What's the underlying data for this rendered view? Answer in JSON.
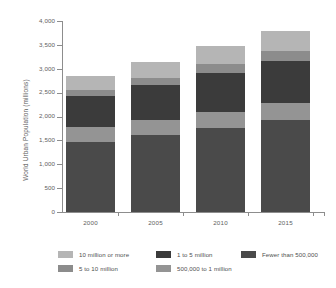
{
  "chart_data": {
    "type": "bar",
    "subtype": "stacked-vertical",
    "title": "",
    "xlabel": "",
    "ylabel": "World Urban Population (millions)",
    "categories": [
      "2000",
      "2005",
      "2010",
      "2015"
    ],
    "ylim": [
      0,
      4000
    ],
    "y_ticks": [
      0,
      500,
      1000,
      1500,
      2000,
      2500,
      3000,
      3500,
      4000
    ],
    "y_tick_labels": [
      "0",
      "500",
      "1,000",
      "1,500",
      "2,000",
      "2,500",
      "3,000",
      "3,500",
      "4,000"
    ],
    "grid": false,
    "legend_position": "bottom",
    "stack_order_bottom_to_top": [
      "Fewer than 500,000",
      "500,000 to 1 million",
      "1 to 5 million",
      "5 to 10 million",
      "10 million or more"
    ],
    "series": [
      {
        "name": "Fewer than 500,000",
        "color": "#4a4a4a",
        "values": [
          1470,
          1610,
          1750,
          1920
        ]
      },
      {
        "name": "500,000 to 1 million",
        "color": "#949494",
        "values": [
          310,
          320,
          350,
          360
        ]
      },
      {
        "name": "1 to 5 million",
        "color": "#3b3b3b",
        "values": [
          640,
          730,
          820,
          890
        ]
      },
      {
        "name": "5 to 10 million",
        "color": "#8c8c8c",
        "values": [
          140,
          150,
          170,
          200
        ]
      },
      {
        "name": "10 million or more",
        "color": "#b5b5b5",
        "values": [
          280,
          330,
          380,
          430
        ]
      }
    ],
    "totals": [
      2840,
      3140,
      3470,
      3800
    ]
  },
  "axis": {
    "y_title": "World Urban Population (millions)",
    "y_labels": [
      "4,000",
      "3,500",
      "3,000",
      "2,500",
      "2,000",
      "1,500",
      "1,000",
      "500",
      "0"
    ],
    "x_labels": [
      "2000",
      "2005",
      "2010",
      "2015"
    ]
  },
  "legend": {
    "items": [
      {
        "label": "10 million or more",
        "color": "#b5b5b5"
      },
      {
        "label": "1 to 5 million",
        "color": "#3b3b3b"
      },
      {
        "label": "Fewer than 500,000",
        "color": "#4a4a4a"
      },
      {
        "label": "5 to 10 million",
        "color": "#8c8c8c"
      },
      {
        "label": "500,000 to 1 million",
        "color": "#949494"
      }
    ]
  },
  "colors": {
    "axis": "#8d8d8d",
    "text": "#5e5e5e",
    "background": "#ffffff"
  }
}
